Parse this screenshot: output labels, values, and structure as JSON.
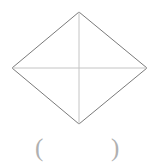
{
  "figure": {
    "name": "rhombus-with-diagonals",
    "background_color": "#ffffff",
    "edge_color": "#7a7a7a",
    "diagonal_color": "#c4c4c4",
    "edge_width": 1,
    "diagonal_width": 1,
    "vertices": {
      "top": {
        "x": 79,
        "y": 12
      },
      "right": {
        "x": 147,
        "y": 68
      },
      "bottom": {
        "x": 79,
        "y": 124
      },
      "left": {
        "x": 12,
        "y": 68
      }
    },
    "center": {
      "x": 79,
      "y": 68
    },
    "polygon_points": "79,12 147,68 79,124 12,68",
    "diagonal_horizontal": {
      "x1": 12,
      "y1": 68,
      "x2": 147,
      "y2": 68
    },
    "diagonal_vertical": {
      "x1": 79,
      "y1": 12,
      "x2": 79,
      "y2": 124
    }
  },
  "answer": {
    "open_paren": "(",
    "close_paren": ")",
    "blank_value": "",
    "paren_color": "#b0b0b0"
  }
}
